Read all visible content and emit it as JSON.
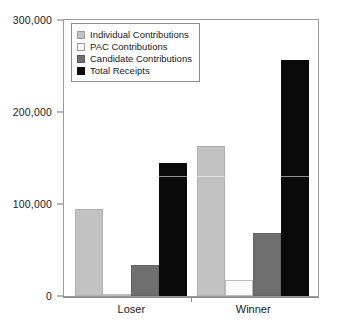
{
  "chart_data": {
    "type": "bar",
    "title": "",
    "xlabel": "",
    "ylabel": "",
    "categories": [
      "Loser",
      "Winner"
    ],
    "ylim": [
      0,
      300000
    ],
    "yticks": [
      0,
      100000,
      200000,
      300000
    ],
    "ytick_labels": [
      "0",
      "100,000",
      "200,000",
      "300,000"
    ],
    "grid": false,
    "legend_position": "upper-left",
    "series": [
      {
        "name": "Individual Contributions",
        "color": "#c2c2c2",
        "values": [
          95000,
          163000
        ]
      },
      {
        "name": "PAC Contributions",
        "color": "#fbfbfb",
        "values": [
          1500,
          17000
        ]
      },
      {
        "name": "Candidate Contributions",
        "color": "#6f6f6f",
        "values": [
          34000,
          69000
        ]
      },
      {
        "name": "Total Receipts",
        "color": "#0a0a0a",
        "values": [
          145000,
          257000
        ]
      }
    ]
  }
}
